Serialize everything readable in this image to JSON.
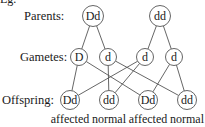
{
  "intro": "Eg.",
  "rows": {
    "parents": "Parents:",
    "gametes": "Gametes:",
    "offspring": "Offspring:"
  },
  "parents": [
    {
      "genotype": "Dd",
      "cx": 93,
      "cy": 16,
      "r": 10.5
    },
    {
      "genotype": "dd",
      "cx": 160,
      "cy": 16,
      "r": 10.5
    }
  ],
  "gametes": [
    {
      "allele": "D",
      "cx": 79,
      "cy": 57,
      "r": 8.5,
      "parent": 0
    },
    {
      "allele": "d",
      "cx": 108,
      "cy": 57,
      "r": 8.5,
      "parent": 0
    },
    {
      "allele": "d",
      "cx": 145,
      "cy": 57,
      "r": 8.5,
      "parent": 1
    },
    {
      "allele": "d",
      "cx": 174,
      "cy": 57,
      "r": 8.5,
      "parent": 1
    }
  ],
  "offspring": [
    {
      "genotype": "Dd",
      "phenotype": "affected",
      "cx": 70,
      "cy": 100,
      "r": 9.5
    },
    {
      "genotype": "dd",
      "phenotype": "normal",
      "cx": 109,
      "cy": 100,
      "r": 9.5
    },
    {
      "genotype": "Dd",
      "phenotype": "affected",
      "cx": 148,
      "cy": 100,
      "r": 9.5
    },
    {
      "genotype": "dd",
      "phenotype": "normal",
      "cx": 187,
      "cy": 100,
      "r": 9.5
    }
  ],
  "crosses": [
    {
      "gamete": 0,
      "offspring": 0
    },
    {
      "gamete": 0,
      "offspring": 2
    },
    {
      "gamete": 1,
      "offspring": 1
    },
    {
      "gamete": 1,
      "offspring": 3
    },
    {
      "gamete": 2,
      "offspring": 0
    },
    {
      "gamete": 2,
      "offspring": 1
    },
    {
      "gamete": 3,
      "offspring": 2
    },
    {
      "gamete": 3,
      "offspring": 3
    }
  ],
  "colors": {
    "stroke": "#555555",
    "text": "#1a1a1a"
  }
}
